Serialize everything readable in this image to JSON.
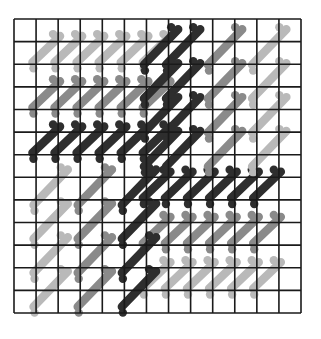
{
  "diagram": {
    "grid": {
      "cols": 13,
      "rows": 13,
      "x0": 14,
      "y0": 19,
      "x1": 301,
      "y1": 313
    },
    "colors": {
      "grid_line": "#1a1a1a",
      "background": "#ffffff",
      "light": "#b9b9b9",
      "medium": "#8a8a8a",
      "dark": "#2e2e2e"
    },
    "stitch_shapes": {
      "H": {
        "dx1": -0.3,
        "dy1": 1.05,
        "dx2": 0.95,
        "dy2": -0.2
      },
      "V": {
        "dx1": -0.25,
        "dy1": 1.55,
        "dx2": 1.3,
        "dy2": -0.1
      }
    },
    "arms": [
      {
        "name": "left-arm-light",
        "shape": "H",
        "shade": "light",
        "rows": [
          1
        ],
        "cols": [
          1,
          2,
          3,
          4,
          5,
          6
        ]
      },
      {
        "name": "left-arm-light-2",
        "shape": "H",
        "shade": "light",
        "rows": [
          8,
          10,
          12
        ],
        "cols": []
      },
      {
        "name": "left-arm-medium",
        "shape": "H",
        "shade": "medium",
        "rows": [
          3
        ],
        "cols": [
          1,
          2,
          3,
          4,
          5,
          6
        ]
      },
      {
        "name": "left-arm-dark",
        "shape": "H",
        "shade": "dark",
        "rows": [
          5
        ],
        "cols": [
          1,
          2,
          3,
          4,
          5,
          6
        ]
      },
      {
        "name": "right-arm-dark",
        "shape": "H",
        "shade": "dark",
        "rows": [
          7
        ],
        "cols": [
          6,
          7,
          8,
          9,
          10,
          11
        ]
      },
      {
        "name": "right-arm-medium",
        "shape": "H",
        "shade": "medium",
        "rows": [
          9
        ],
        "cols": [
          6,
          7,
          8,
          9,
          10,
          11
        ]
      },
      {
        "name": "right-arm-light",
        "shape": "H",
        "shade": "light",
        "rows": [
          11
        ],
        "cols": [
          6,
          7,
          8,
          9,
          10,
          11
        ]
      },
      {
        "name": "top-arm-dark",
        "shape": "V",
        "shade": "dark",
        "cols": [
          7
        ],
        "rows": [
          0.6,
          2.1,
          3.6,
          5.1
        ]
      },
      {
        "name": "top-arm-dark-2",
        "shape": "V",
        "shade": "dark",
        "cols": [
          6
        ],
        "rows": [
          0.6,
          2.1,
          3.6,
          5.1
        ]
      },
      {
        "name": "top-arm-medium",
        "shape": "V",
        "shade": "medium",
        "cols": [
          8.9
        ],
        "rows": [
          0.6,
          2.1,
          3.6,
          5.1
        ]
      },
      {
        "name": "top-arm-light",
        "shape": "V",
        "shade": "light",
        "cols": [
          10.9
        ],
        "rows": [
          0.6,
          2.1,
          3.6,
          5.1
        ]
      },
      {
        "name": "bottom-arm-light",
        "shape": "V",
        "shade": "light",
        "cols": [
          1
        ],
        "rows": [
          6.8,
          8.3,
          9.8,
          11.3
        ]
      },
      {
        "name": "bottom-arm-medium",
        "shape": "V",
        "shade": "medium",
        "cols": [
          3
        ],
        "rows": [
          6.8,
          8.3,
          9.8,
          11.3
        ]
      },
      {
        "name": "bottom-arm-dark",
        "shape": "V",
        "shade": "dark",
        "cols": [
          5
        ],
        "rows": [
          6.8,
          8.3,
          9.8,
          11.3
        ]
      }
    ]
  }
}
